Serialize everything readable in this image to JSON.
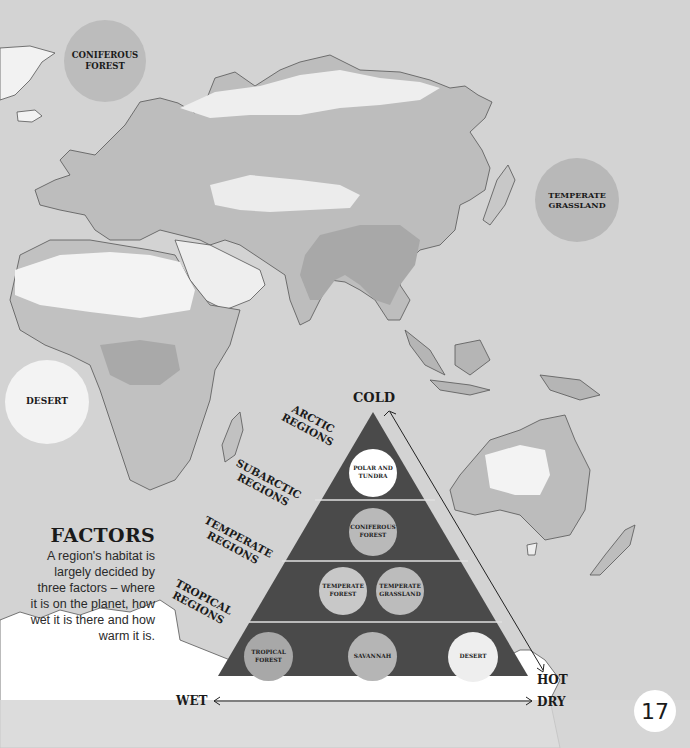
{
  "page": {
    "number": "17",
    "colors": {
      "background": "#d3d3d3",
      "pyramid_fill": "#4a4a4a",
      "desert_bubble": "#f3f3f3",
      "forest_bubble": "#bcbcbc",
      "text": "#1a1a1a"
    }
  },
  "map_bubbles": [
    {
      "label": "CONIFEROUS\nFOREST"
    },
    {
      "label": "TEMPERATE\nGRASSLAND"
    },
    {
      "label": "DESERT"
    }
  ],
  "factors": {
    "heading": "FACTORS",
    "body": "A region's habitat is largely decided by three factors – where it is on the planet, how wet it is there and how warm it is."
  },
  "pyramid": {
    "axes": {
      "top": "COLD",
      "bottom_left": "WET",
      "bottom_right_hot": "HOT",
      "bottom_right_dry": "DRY"
    },
    "regions": [
      {
        "label": "ARCTIC\nREGIONS",
        "habitats": [
          "POLAR AND\nTUNDRA"
        ]
      },
      {
        "label": "SUBARCTIC\nREGIONS",
        "habitats": [
          "CONIFEROUS\nFOREST"
        ]
      },
      {
        "label": "TEMPERATE\nREGIONS",
        "habitats": [
          "TEMPERATE\nFOREST",
          "TEMPERATE\nGRASSLAND"
        ]
      },
      {
        "label": "TROPICAL\nREGIONS",
        "habitats": [
          "TROPICAL\nFOREST",
          "SAVANNAH",
          "DESERT"
        ]
      }
    ]
  }
}
